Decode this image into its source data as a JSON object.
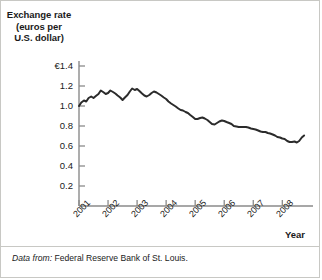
{
  "chart_data": {
    "type": "line",
    "title": "Exchange rate (euros per U.S. dollar)",
    "title_lines": [
      "Exchange rate",
      "(euros per",
      "U.S. dollar)"
    ],
    "xlabel": "Year",
    "ylabel": "Exchange rate (euros per U.S. dollar)",
    "grid": false,
    "legend": "none",
    "xlim": [
      2001.0,
      2008.85
    ],
    "ylim": [
      0.0,
      1.45
    ],
    "yticks": [
      0.2,
      0.4,
      0.6,
      0.8,
      1.0,
      1.2,
      1.4
    ],
    "ytick_labels": [
      "0.2",
      "0.4",
      "0.6",
      "0.8",
      "1.0",
      "1.2",
      "€1.4"
    ],
    "xticks": [
      2001,
      2002,
      2003,
      2004,
      2005,
      2006,
      2007,
      2008
    ],
    "xtick_labels": [
      "2001",
      "2002",
      "2003",
      "2004",
      "2005",
      "2006",
      "2007",
      "2008"
    ],
    "series": [
      {
        "name": "Euros per U.S. dollar",
        "color": "#2b2b2b",
        "x": [
          2001.0,
          2001.08,
          2001.17,
          2001.25,
          2001.33,
          2001.42,
          2001.5,
          2001.58,
          2001.67,
          2001.75,
          2001.83,
          2001.92,
          2002.0,
          2002.08,
          2002.17,
          2002.25,
          2002.33,
          2002.42,
          2002.5,
          2002.58,
          2002.67,
          2002.75,
          2002.83,
          2002.92,
          2003.0,
          2003.08,
          2003.17,
          2003.25,
          2003.33,
          2003.42,
          2003.5,
          2003.58,
          2003.67,
          2003.75,
          2003.83,
          2003.92,
          2004.0,
          2004.08,
          2004.17,
          2004.25,
          2004.33,
          2004.42,
          2004.5,
          2004.58,
          2004.67,
          2004.75,
          2004.83,
          2004.92,
          2005.0,
          2005.08,
          2005.17,
          2005.25,
          2005.33,
          2005.42,
          2005.5,
          2005.58,
          2005.67,
          2005.75,
          2005.83,
          2005.92,
          2006.0,
          2006.08,
          2006.17,
          2006.25,
          2006.33,
          2006.42,
          2006.5,
          2006.58,
          2006.67,
          2006.75,
          2006.83,
          2006.92,
          2007.0,
          2007.08,
          2007.17,
          2007.25,
          2007.33,
          2007.42,
          2007.5,
          2007.58,
          2007.67,
          2007.75,
          2007.83,
          2007.92,
          2008.0,
          2008.08,
          2008.17,
          2008.25,
          2008.33,
          2008.42,
          2008.5,
          2008.58,
          2008.67,
          2008.75
        ],
        "y": [
          1.0,
          1.035,
          1.055,
          1.045,
          1.08,
          1.095,
          1.08,
          1.1,
          1.12,
          1.155,
          1.14,
          1.12,
          1.13,
          1.155,
          1.14,
          1.125,
          1.105,
          1.085,
          1.06,
          1.085,
          1.11,
          1.145,
          1.175,
          1.16,
          1.17,
          1.15,
          1.125,
          1.105,
          1.095,
          1.11,
          1.13,
          1.145,
          1.135,
          1.12,
          1.105,
          1.085,
          1.07,
          1.045,
          1.025,
          1.01,
          0.995,
          0.975,
          0.96,
          0.955,
          0.94,
          0.93,
          0.91,
          0.89,
          0.87,
          0.87,
          0.88,
          0.885,
          0.875,
          0.86,
          0.84,
          0.82,
          0.815,
          0.83,
          0.845,
          0.855,
          0.85,
          0.84,
          0.83,
          0.82,
          0.8,
          0.795,
          0.79,
          0.79,
          0.79,
          0.79,
          0.785,
          0.775,
          0.77,
          0.765,
          0.755,
          0.745,
          0.74,
          0.74,
          0.73,
          0.725,
          0.715,
          0.705,
          0.69,
          0.685,
          0.675,
          0.67,
          0.65,
          0.64,
          0.64,
          0.645,
          0.635,
          0.65,
          0.685,
          0.705
        ]
      }
    ]
  },
  "footer": {
    "source_lead": "Data from:",
    "source_text": "Federal Reserve Bank of St. Louis."
  }
}
